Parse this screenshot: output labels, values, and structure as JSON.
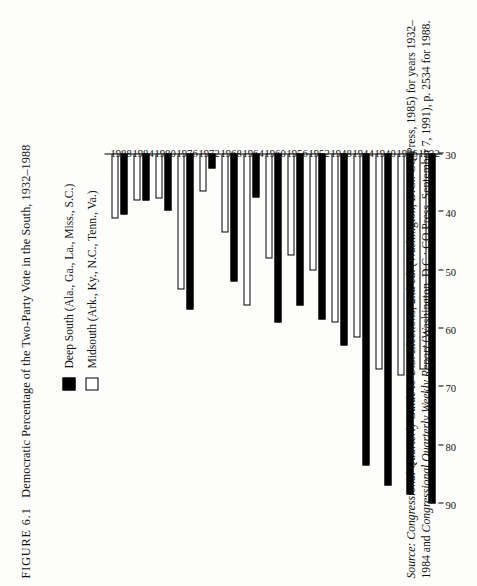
{
  "figure": {
    "number": "FIGURE 6.1",
    "title": "Democratic Percentage of the Two-Party Vote in the South, 1932–1988"
  },
  "legend": {
    "position": "top-center",
    "items": [
      {
        "swatch": "filled-black-square",
        "label": "Deep South (Ala., Ga., La., Miss., S.C.)"
      },
      {
        "swatch": "open-white-square",
        "label": "Midsouth (Ark., Ky., N.C., Tenn., Va.)"
      }
    ]
  },
  "source": {
    "prefix": "Source:",
    "line1_italic_a": "Congressional Quarterly Guide to U.S. Elections,",
    "line1_rest": " 2nd ed. (Washington, D.C.: CQ Press, 1985) for years 1932–1984 and ",
    "line2_italic_b": "Congressional Quarterly Weekly Report",
    "line2_rest": " (Washington, D.C.: CQ Press, September 7, 1991), p. 2534 for 1988."
  },
  "chart_data": {
    "type": "bar",
    "orientation": "horizontal",
    "title": "Democratic Percentage of the Two-Party Vote in the South, 1932–1988",
    "xlabel": "",
    "ylabel": "",
    "categories": [
      "1932",
      "1936",
      "1940",
      "1944",
      "1948",
      "1952",
      "1956",
      "1960",
      "1964",
      "1968",
      "1972",
      "1976",
      "1980",
      "1984",
      "1988"
    ],
    "tick_values": [
      90,
      80,
      70,
      60,
      50,
      40,
      30
    ],
    "axis_min": 30,
    "axis_max": 90,
    "grid": false,
    "series": [
      {
        "name": "Deep South (Ala., Ga., La., Miss., S.C.)",
        "color": "#000000",
        "fill": "solid",
        "values": [
          90.0,
          88.5,
          87.0,
          83.5,
          63.0,
          58.5,
          56.0,
          59.0,
          37.5,
          52.0,
          32.5,
          56.8,
          39.8,
          38.0,
          40.4
        ]
      },
      {
        "name": "Midsouth (Ark., Ky., N.C., Tenn., Va.)",
        "color": "#ffffff",
        "fill": "open",
        "values": [
          67.0,
          68.0,
          67.0,
          61.5,
          59.0,
          50.0,
          47.5,
          48.0,
          56.0,
          43.5,
          36.5,
          53.3,
          37.7,
          38.1,
          41.1
        ]
      }
    ]
  }
}
